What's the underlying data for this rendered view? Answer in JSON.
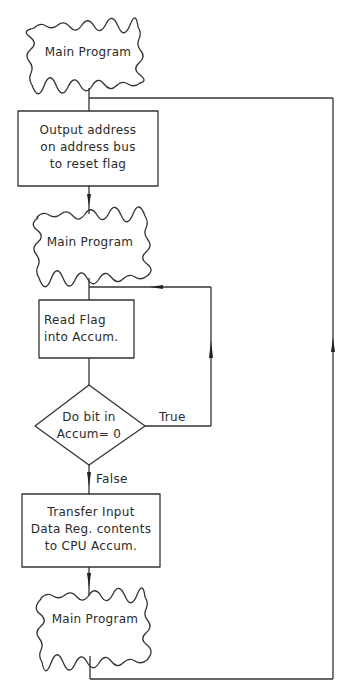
{
  "diagram": {
    "type": "flowchart",
    "stroke_color": "#333333",
    "nodes": [
      {
        "id": "main1",
        "shape": "wavy-terminal",
        "label": "Main Program"
      },
      {
        "id": "output",
        "shape": "process",
        "label": "Output address\non address bus\nto reset flag"
      },
      {
        "id": "main2",
        "shape": "wavy-terminal",
        "label": "Main Program"
      },
      {
        "id": "read",
        "shape": "process",
        "label": "Read  Flag\ninto Accum."
      },
      {
        "id": "decision",
        "shape": "decision",
        "label": "Do  bit  in\nAccum= 0"
      },
      {
        "id": "transfer",
        "shape": "process",
        "label": "Transfer Input\nData  Reg. contents\nto  CPU  Accum."
      },
      {
        "id": "main3",
        "shape": "wavy-terminal",
        "label": "Main Program"
      }
    ],
    "edges": [
      {
        "from": "main1",
        "to": "output",
        "label": ""
      },
      {
        "from": "output",
        "to": "main2",
        "label": ""
      },
      {
        "from": "main2",
        "to": "read",
        "label": ""
      },
      {
        "from": "read",
        "to": "decision",
        "label": ""
      },
      {
        "from": "decision",
        "to": "read",
        "label": "True"
      },
      {
        "from": "decision",
        "to": "transfer",
        "label": "False"
      },
      {
        "from": "transfer",
        "to": "main3",
        "label": ""
      },
      {
        "from": "main3",
        "to": "output",
        "label": ""
      }
    ]
  }
}
